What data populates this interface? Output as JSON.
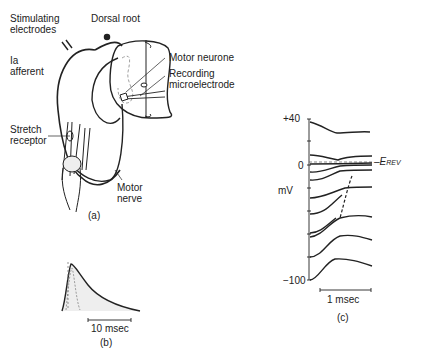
{
  "panel_a": {
    "caption": "(a)",
    "labels": {
      "stimulating_1": "Stimulating",
      "stimulating_2": "electrodes",
      "dorsal_root": "Dorsal root",
      "ia_1": "Ia",
      "ia_2": "afferent",
      "motor_neurone": "Motor neurone",
      "recording_1": "Recording",
      "recording_2": "microelectrode",
      "stretch_1": "Stretch",
      "stretch_2": "receptor",
      "motor_nerve_1": "Motor",
      "motor_nerve_2": "nerve"
    }
  },
  "panel_b": {
    "caption": "(b)",
    "scale_label": "10 msec"
  },
  "panel_c": {
    "caption": "(c)",
    "y_unit": "mV",
    "ticks": {
      "top": "+40",
      "zero": "0",
      "bottom": "−100"
    },
    "reversal_label": "–E",
    "reversal_sub": "REV",
    "scale_label": "1 msec"
  }
}
